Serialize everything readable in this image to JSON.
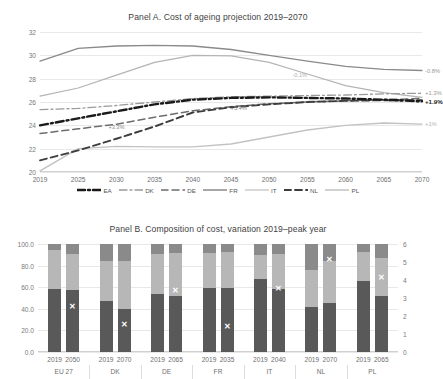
{
  "panelA": {
    "title": "Panel A. Cost of ageing projection 2019–2070",
    "yticks": [
      "20",
      "22",
      "24",
      "26",
      "28",
      "30",
      "32"
    ],
    "xticks": [
      "2019",
      "2025",
      "2030",
      "2035",
      "2040",
      "2045",
      "2050",
      "2055",
      "2060",
      "2065",
      "2070"
    ],
    "legend": [
      {
        "label": "EA",
        "color": "#1a1a1a",
        "dash": "8,3,2,3",
        "width": 2.4
      },
      {
        "label": "DK",
        "color": "#9a9a9a",
        "dash": "8,3,2,3",
        "width": 1.3
      },
      {
        "label": "DE",
        "color": "#6d6d6d",
        "dash": "7,4",
        "width": 1.5
      },
      {
        "label": "FR",
        "color": "#8a8a8a",
        "dash": "none",
        "width": 1.3
      },
      {
        "label": "IT",
        "color": "#b4b4b4",
        "dash": "none",
        "width": 1.2
      },
      {
        "label": "NL",
        "color": "#3d3d3d",
        "dash": "7,4",
        "width": 1.9
      },
      {
        "label": "PL",
        "color": "#c2c2c2",
        "dash": "none",
        "width": 1.4
      }
    ],
    "inline_labels": [
      {
        "text": "+3.3%",
        "x": 2030,
        "y": 23.85,
        "color": "#8a8a8a"
      },
      {
        "text": "+5.4%",
        "x": 2046,
        "y": 25.45,
        "color": "#8a8a8a"
      },
      {
        "text": "-0.1%",
        "x": 2054,
        "y": 28.35,
        "color": "#b0b0b0"
      }
    ],
    "end_labels": [
      {
        "text": "-0.8%",
        "y": 28.7,
        "color": "#9a9a9a"
      },
      {
        "text": "+1.3%",
        "y": 26.75,
        "color": "#9a9a9a"
      },
      {
        "text": "+1.9%",
        "y": 26.05,
        "color": "#1a1a1a",
        "bold": true
      },
      {
        "text": "+1%",
        "y": 24.1,
        "color": "#b4b4b4"
      }
    ]
  },
  "panelB": {
    "title": "Panel B. Composition of cost, variation 2019–peak year",
    "yticks_left": [
      "0.0",
      "20.0",
      "40.0",
      "60.0",
      "80.0",
      "100.0"
    ],
    "yticks_right": [
      "0",
      "1",
      "2",
      "3",
      "4",
      "5",
      "6"
    ],
    "groups": [
      "EU 27",
      "DK",
      "DE",
      "FR",
      "IT",
      "NL",
      "PL"
    ],
    "colors": {
      "s1": "#595959",
      "s2": "#b7b7b7",
      "s3": "#8a8a8a",
      "marker": "#ffffff"
    }
  },
  "chart_data": [
    {
      "type": "line",
      "title": "Panel A. Cost of ageing projection 2019–2070",
      "xlabel": "",
      "ylabel": "",
      "x": [
        2019,
        2025,
        2030,
        2035,
        2040,
        2045,
        2050,
        2055,
        2060,
        2065,
        2070
      ],
      "ylim": [
        20,
        32
      ],
      "xlim": [
        2019,
        2070
      ],
      "grid": true,
      "legend_position": "bottom",
      "series": [
        {
          "name": "EA",
          "values": [
            24.0,
            24.6,
            25.2,
            25.8,
            26.2,
            26.35,
            26.4,
            26.35,
            26.3,
            26.2,
            26.05
          ],
          "end_label": "+1.9%"
        },
        {
          "name": "DK",
          "values": [
            25.35,
            25.45,
            25.7,
            26.0,
            26.3,
            26.45,
            26.5,
            26.55,
            26.6,
            26.7,
            26.75
          ],
          "end_label": "+1.3%"
        },
        {
          "name": "DE",
          "values": [
            23.3,
            23.7,
            24.1,
            24.7,
            25.25,
            25.6,
            25.85,
            26.0,
            26.1,
            26.2,
            26.3
          ],
          "end_label": "+3.3%"
        },
        {
          "name": "FR",
          "values": [
            29.5,
            30.6,
            30.8,
            30.85,
            30.8,
            30.5,
            30.0,
            29.5,
            29.05,
            28.8,
            28.7
          ],
          "end_label": "-0.8%"
        },
        {
          "name": "IT",
          "values": [
            26.5,
            27.2,
            28.3,
            29.4,
            30.0,
            29.95,
            29.4,
            28.4,
            27.4,
            26.8,
            26.4
          ],
          "end_label": "-0.1%"
        },
        {
          "name": "NL",
          "values": [
            21.0,
            21.85,
            22.85,
            23.9,
            25.1,
            25.55,
            25.8,
            26.0,
            26.1,
            26.15,
            26.15
          ],
          "end_label": "+5.4%"
        },
        {
          "name": "PL",
          "values": [
            20.1,
            22.0,
            22.2,
            22.15,
            22.15,
            22.4,
            23.0,
            23.6,
            24.0,
            24.2,
            24.1
          ],
          "end_label": "+1%"
        }
      ],
      "annotations": [
        "+3.3%",
        "+5.4%",
        "-0.1%",
        "-0.8%",
        "+1.3%",
        "+1.9%",
        "+1%"
      ]
    },
    {
      "type": "bar",
      "subtype": "stacked-column",
      "title": "Panel B. Composition of cost, variation 2019–peak year",
      "xlabel": "",
      "ylabel": "",
      "ylim": [
        0,
        100
      ],
      "y2lim": [
        0,
        6
      ],
      "grid": true,
      "categories": [
        {
          "group": "EU 27",
          "year": "2019"
        },
        {
          "group": "EU 27",
          "year": "2050"
        },
        {
          "group": "DK",
          "year": "2019"
        },
        {
          "group": "DK",
          "year": "2070"
        },
        {
          "group": "DE",
          "year": "2019"
        },
        {
          "group": "DE",
          "year": "2065"
        },
        {
          "group": "FR",
          "year": "2019"
        },
        {
          "group": "FR",
          "year": "2035"
        },
        {
          "group": "IT",
          "year": "2019"
        },
        {
          "group": "IT",
          "year": "2040"
        },
        {
          "group": "NL",
          "year": "2019"
        },
        {
          "group": "NL",
          "year": "2070"
        },
        {
          "group": "PL",
          "year": "2019"
        },
        {
          "group": "PL",
          "year": "2065"
        }
      ],
      "series": [
        {
          "name": "segment-1",
          "values": [
            58.0,
            57.0,
            47.0,
            39.5,
            53.5,
            52.0,
            59.5,
            59.5,
            67.5,
            58.0,
            41.5,
            45.0,
            65.5,
            51.5
          ]
        },
        {
          "name": "segment-2",
          "values": [
            36.5,
            33.5,
            37.0,
            44.5,
            37.5,
            40.0,
            32.0,
            33.5,
            22.5,
            33.0,
            34.0,
            39.0,
            27.0,
            35.5
          ]
        },
        {
          "name": "segment-3",
          "values": [
            5.5,
            9.5,
            16.0,
            16.0,
            9.0,
            8.0,
            8.5,
            7.0,
            10.0,
            9.0,
            24.5,
            16.0,
            7.5,
            13.0
          ]
        }
      ],
      "markers": {
        "name": "variation-marker",
        "axis": "secondary",
        "values": [
          null,
          2.5,
          null,
          1.5,
          null,
          3.4,
          null,
          1.4,
          null,
          3.5,
          null,
          5.1,
          null,
          4.1
        ]
      }
    }
  ]
}
